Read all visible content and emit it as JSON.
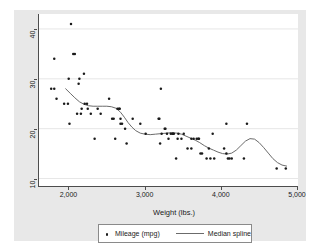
{
  "chart_data": {
    "type": "scatter",
    "title": "",
    "subtitle": "",
    "xlabel": "Weight (lbs.)",
    "ylabel": "",
    "xlim": [
      1600,
      5000
    ],
    "ylim": [
      8.5,
      43
    ],
    "xticks": [
      2000,
      3000,
      4000,
      5000
    ],
    "xtick_labels": [
      "2,000",
      "3,000",
      "4,000",
      "5,000"
    ],
    "yticks": [
      10,
      20,
      30,
      40
    ],
    "ytick_labels": [
      "10",
      "20",
      "30",
      "40"
    ],
    "grid": "horizontal",
    "legend_position": "bottom",
    "legend": [
      {
        "label": "Mileage (mpg)",
        "marker": "dot",
        "color": "#1a1a1a"
      },
      {
        "label": "Median spline",
        "marker": "line",
        "color": "#6b6b6b"
      }
    ],
    "series": [
      {
        "name": "Mileage (mpg)",
        "type": "scatter",
        "marker": "dot",
        "color": "#1a1a1a",
        "points": [
          [
            1760,
            28
          ],
          [
            1800,
            28
          ],
          [
            1800,
            34
          ],
          [
            1830,
            26
          ],
          [
            1930,
            25
          ],
          [
            1980,
            25
          ],
          [
            1990,
            30
          ],
          [
            2000,
            21
          ],
          [
            2020,
            41
          ],
          [
            2050,
            35
          ],
          [
            2070,
            35
          ],
          [
            2100,
            23
          ],
          [
            2120,
            29
          ],
          [
            2130,
            30
          ],
          [
            2150,
            23
          ],
          [
            2160,
            24
          ],
          [
            2190,
            31
          ],
          [
            2200,
            25
          ],
          [
            2230,
            25
          ],
          [
            2240,
            24
          ],
          [
            2280,
            23
          ],
          [
            2330,
            18
          ],
          [
            2370,
            24
          ],
          [
            2410,
            23
          ],
          [
            2520,
            26
          ],
          [
            2560,
            22
          ],
          [
            2580,
            22
          ],
          [
            2600,
            18
          ],
          [
            2630,
            24
          ],
          [
            2650,
            24
          ],
          [
            2660,
            24
          ],
          [
            2670,
            21
          ],
          [
            2670,
            22
          ],
          [
            2690,
            21
          ],
          [
            2730,
            20
          ],
          [
            2750,
            17
          ],
          [
            2830,
            22
          ],
          [
            2930,
            21
          ],
          [
            3000,
            19
          ],
          [
            3170,
            22
          ],
          [
            3180,
            22
          ],
          [
            3190,
            17
          ],
          [
            3200,
            28
          ],
          [
            3210,
            19
          ],
          [
            3250,
            20
          ],
          [
            3260,
            20
          ],
          [
            3280,
            19
          ],
          [
            3300,
            18
          ],
          [
            3330,
            19
          ],
          [
            3350,
            19
          ],
          [
            3360,
            19
          ],
          [
            3370,
            19
          ],
          [
            3400,
            14
          ],
          [
            3420,
            18
          ],
          [
            3430,
            19
          ],
          [
            3470,
            18
          ],
          [
            3500,
            19
          ],
          [
            3550,
            16
          ],
          [
            3600,
            16
          ],
          [
            3600,
            18
          ],
          [
            3630,
            18
          ],
          [
            3670,
            18
          ],
          [
            3690,
            18
          ],
          [
            3700,
            18
          ],
          [
            3720,
            15
          ],
          [
            3740,
            15
          ],
          [
            3800,
            14
          ],
          [
            3830,
            16
          ],
          [
            3850,
            14
          ],
          [
            3880,
            19
          ],
          [
            3900,
            14
          ],
          [
            4030,
            16
          ],
          [
            4060,
            15
          ],
          [
            4060,
            21
          ],
          [
            4080,
            14
          ],
          [
            4100,
            14
          ],
          [
            4130,
            14
          ],
          [
            4290,
            14
          ],
          [
            4330,
            21
          ],
          [
            4720,
            12
          ],
          [
            4840,
            12
          ]
        ]
      },
      {
        "name": "Median spline",
        "type": "line",
        "color": "#6b6b6b",
        "points": [
          [
            1950,
            28.0
          ],
          [
            2010,
            27.1
          ],
          [
            2070,
            26.2
          ],
          [
            2130,
            25.4
          ],
          [
            2190,
            24.9
          ],
          [
            2250,
            24.6
          ],
          [
            2310,
            24.5
          ],
          [
            2370,
            24.5
          ],
          [
            2430,
            24.5
          ],
          [
            2490,
            24.5
          ],
          [
            2550,
            24.4
          ],
          [
            2610,
            24.1
          ],
          [
            2670,
            23.3
          ],
          [
            2720,
            22.3
          ],
          [
            2770,
            21.2
          ],
          [
            2820,
            20.3
          ],
          [
            2870,
            19.6
          ],
          [
            2930,
            19.1
          ],
          [
            2990,
            18.9
          ],
          [
            3060,
            18.8
          ],
          [
            3130,
            18.9
          ],
          [
            3200,
            19.0
          ],
          [
            3270,
            19.1
          ],
          [
            3340,
            19.2
          ],
          [
            3410,
            19.1
          ],
          [
            3470,
            18.9
          ],
          [
            3530,
            18.5
          ],
          [
            3590,
            18.1
          ],
          [
            3650,
            17.7
          ],
          [
            3710,
            17.2
          ],
          [
            3770,
            16.6
          ],
          [
            3830,
            16.1
          ],
          [
            3890,
            15.7
          ],
          [
            3950,
            15.3
          ],
          [
            4010,
            15.0
          ],
          [
            4070,
            14.9
          ],
          [
            4130,
            15.1
          ],
          [
            4190,
            15.7
          ],
          [
            4250,
            16.6
          ],
          [
            4310,
            17.5
          ],
          [
            4370,
            18.0
          ],
          [
            4430,
            17.9
          ],
          [
            4490,
            17.2
          ],
          [
            4550,
            16.2
          ],
          [
            4610,
            15.1
          ],
          [
            4670,
            14.0
          ],
          [
            4730,
            13.2
          ],
          [
            4790,
            12.7
          ],
          [
            4850,
            12.5
          ]
        ]
      }
    ]
  },
  "axes": {
    "x_title": "Weight (lbs.)"
  },
  "legend": {
    "entries": [
      {
        "label": "Mileage (mpg)"
      },
      {
        "label": "Median spline"
      }
    ]
  }
}
